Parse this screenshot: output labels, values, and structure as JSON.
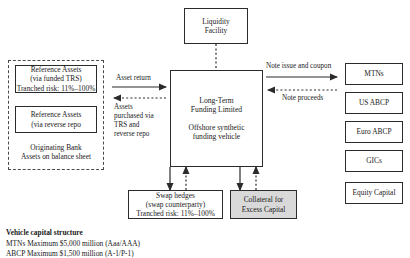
{
  "diagram": {
    "liquidity_facility": {
      "line1": "Liquidity",
      "line2": "Facility"
    },
    "vehicle": {
      "name_line1": "Long-Term",
      "name_line2": "Funding Limited",
      "desc_line1": "Offshore synthetic",
      "desc_line2": "funding vehicle"
    },
    "originator_group": {
      "asset_box_1": {
        "line1": "Reference Assets",
        "line2": "(via funded TRS)",
        "line3": "Tranched risk: 11%–100%"
      },
      "asset_box_2": {
        "line1": "Reference Assets",
        "line2": "(via reverse repo"
      },
      "footer_line1": "Originating Bank",
      "footer_line2": "Assets on balance sheet"
    },
    "flows": {
      "asset_return": "Asset return",
      "assets_purchased_line1": "Assets",
      "assets_purchased_line2": "purchased via",
      "assets_purchased_line3": "TRS and",
      "assets_purchased_line4": "reverse repo",
      "note_issue": "Note issue and coupon",
      "note_proceeds": "Note proceeds"
    },
    "funding_instruments": [
      {
        "label": "MTNs"
      },
      {
        "label": "US ABCP"
      },
      {
        "label": "Euro ABCP"
      },
      {
        "label": "GICs"
      },
      {
        "label": "Equity Capital"
      }
    ],
    "swap_hedges": {
      "line1": "Swap hedges",
      "line2": "(swap counterparty)",
      "line3": "Tranched risk: 11%–100%"
    },
    "collateral": {
      "line1": "Collateral for",
      "line2": "Excess Capital"
    },
    "caption": {
      "title": "Vehicle capital structure",
      "line1": "MTNs Maximum $5,000 million (Aaa/AAA)",
      "line2": "ABCP Maximum $1,500 million (A-1/P-1)"
    },
    "colors": {
      "line": "#2b2b2b",
      "shaded_fill": "#d9d9d9",
      "dashed_border": "#4a4a4a"
    }
  }
}
